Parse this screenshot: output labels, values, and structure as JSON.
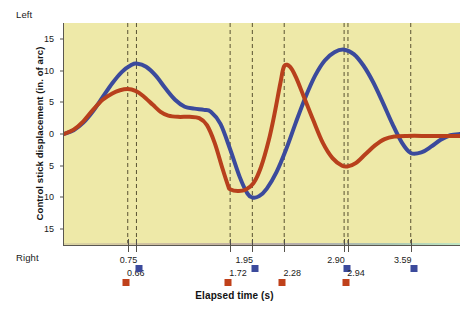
{
  "chart_data": {
    "type": "line",
    "title": "",
    "xlabel": "Elapsed time (s)",
    "ylabel": "Control stick displacement (in. of arc)",
    "y_top_word": "Left",
    "y_bottom_word": "Right",
    "xlim": [
      0.0,
      4.1
    ],
    "ylim": [
      -17.5,
      17.5
    ],
    "grid": false,
    "legend_position": "none",
    "yticks": [
      {
        "value": 15,
        "label": "15"
      },
      {
        "value": 10,
        "label": "10"
      },
      {
        "value": 5,
        "label": "5"
      },
      {
        "value": 0,
        "label": "0"
      },
      {
        "value": -5,
        "label": "5"
      },
      {
        "value": -10,
        "label": "10"
      },
      {
        "value": -15,
        "label": "15"
      }
    ],
    "xticks": [
      0.66,
      0.75,
      1.72,
      1.95,
      2.28,
      2.9,
      2.94,
      3.59
    ],
    "annotations": [
      {
        "label": "0.66",
        "x": 0.66,
        "color": "red",
        "marker": "square",
        "row": 2
      },
      {
        "label": "0.75",
        "x": 0.75,
        "color": "blue",
        "marker": "square",
        "row": 1
      },
      {
        "label": "1.72",
        "x": 1.72,
        "color": "red",
        "marker": "square",
        "row": 2
      },
      {
        "label": "1.95",
        "x": 1.95,
        "color": "blue",
        "marker": "square",
        "row": 1
      },
      {
        "label": "2.28",
        "x": 2.28,
        "color": "red",
        "marker": "square",
        "row": 2
      },
      {
        "label": "2.90",
        "x": 2.9,
        "color": "blue",
        "marker": "square",
        "row": 1
      },
      {
        "label": "2.94",
        "x": 2.94,
        "color": "red",
        "marker": "square",
        "row": 2
      },
      {
        "label": "3.59",
        "x": 3.59,
        "color": "blue",
        "marker": "square",
        "row": 1
      }
    ],
    "series": [
      {
        "name": "blue-trace",
        "color": "#3b4a9c",
        "points": [
          [
            0.0,
            0.0
          ],
          [
            0.1,
            0.6
          ],
          [
            0.2,
            1.8
          ],
          [
            0.3,
            3.6
          ],
          [
            0.4,
            5.8
          ],
          [
            0.5,
            8.0
          ],
          [
            0.6,
            9.8
          ],
          [
            0.7,
            10.9
          ],
          [
            0.75,
            11.1
          ],
          [
            0.85,
            10.6
          ],
          [
            0.95,
            9.2
          ],
          [
            1.05,
            7.2
          ],
          [
            1.15,
            5.4
          ],
          [
            1.25,
            4.3
          ],
          [
            1.35,
            4.0
          ],
          [
            1.45,
            3.8
          ],
          [
            1.52,
            3.5
          ],
          [
            1.62,
            1.6
          ],
          [
            1.72,
            -2.4
          ],
          [
            1.82,
            -6.8
          ],
          [
            1.9,
            -9.4
          ],
          [
            1.95,
            -10.0
          ],
          [
            2.02,
            -9.8
          ],
          [
            2.1,
            -8.6
          ],
          [
            2.2,
            -6.0
          ],
          [
            2.3,
            -2.4
          ],
          [
            2.4,
            1.8
          ],
          [
            2.5,
            5.8
          ],
          [
            2.6,
            9.2
          ],
          [
            2.7,
            11.6
          ],
          [
            2.8,
            12.9
          ],
          [
            2.9,
            13.3
          ],
          [
            3.0,
            12.6
          ],
          [
            3.1,
            10.8
          ],
          [
            3.2,
            8.2
          ],
          [
            3.3,
            5.0
          ],
          [
            3.4,
            1.6
          ],
          [
            3.5,
            -1.4
          ],
          [
            3.59,
            -3.0
          ],
          [
            3.7,
            -2.9
          ],
          [
            3.8,
            -2.0
          ],
          [
            3.9,
            -0.9
          ],
          [
            4.0,
            -0.2
          ],
          [
            4.1,
            0.0
          ]
        ]
      },
      {
        "name": "red-trace",
        "color": "#b8401c",
        "points": [
          [
            0.0,
            0.0
          ],
          [
            0.1,
            0.7
          ],
          [
            0.2,
            2.0
          ],
          [
            0.3,
            3.8
          ],
          [
            0.4,
            5.4
          ],
          [
            0.5,
            6.4
          ],
          [
            0.58,
            6.9
          ],
          [
            0.66,
            7.1
          ],
          [
            0.74,
            6.8
          ],
          [
            0.82,
            6.0
          ],
          [
            0.92,
            4.6
          ],
          [
            1.0,
            3.5
          ],
          [
            1.08,
            2.9
          ],
          [
            1.18,
            2.7
          ],
          [
            1.3,
            2.7
          ],
          [
            1.4,
            2.5
          ],
          [
            1.48,
            1.4
          ],
          [
            1.56,
            -1.4
          ],
          [
            1.64,
            -5.4
          ],
          [
            1.7,
            -8.2
          ],
          [
            1.72,
            -8.7
          ],
          [
            1.8,
            -9.0
          ],
          [
            1.88,
            -8.8
          ],
          [
            1.96,
            -7.8
          ],
          [
            2.04,
            -5.2
          ],
          [
            2.12,
            -1.0
          ],
          [
            2.18,
            3.2
          ],
          [
            2.24,
            8.0
          ],
          [
            2.28,
            10.7
          ],
          [
            2.34,
            10.6
          ],
          [
            2.4,
            9.0
          ],
          [
            2.48,
            6.0
          ],
          [
            2.58,
            2.2
          ],
          [
            2.68,
            -1.4
          ],
          [
            2.78,
            -3.8
          ],
          [
            2.88,
            -5.0
          ],
          [
            2.94,
            -5.1
          ],
          [
            3.02,
            -4.6
          ],
          [
            3.12,
            -3.2
          ],
          [
            3.22,
            -1.8
          ],
          [
            3.32,
            -0.8
          ],
          [
            3.42,
            -0.4
          ],
          [
            3.55,
            -0.3
          ],
          [
            3.8,
            -0.3
          ],
          [
            4.1,
            -0.3
          ]
        ]
      }
    ]
  }
}
